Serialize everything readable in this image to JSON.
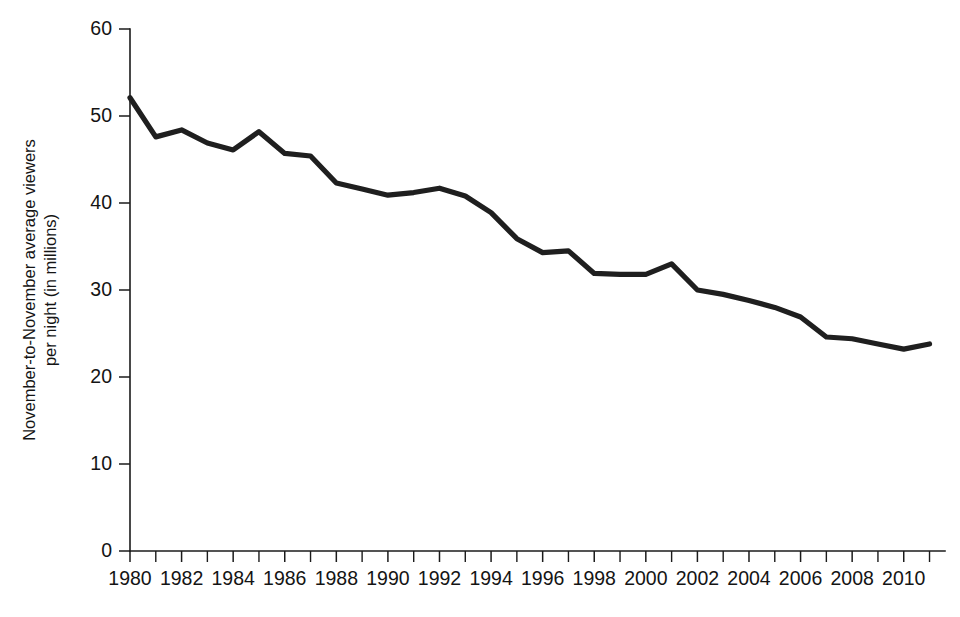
{
  "chart_data": {
    "type": "line",
    "title": "",
    "subtitle": "",
    "xlabel": "",
    "ylabel_line1": "November-to-November average viewers",
    "ylabel_line2": "per night  (in millions)",
    "ylabel": "November-to-November average viewers per night (in millions)",
    "grid": false,
    "legend_position": "none",
    "xlim": [
      1980,
      2011.6
    ],
    "ylim": [
      0,
      60
    ],
    "y_ticks": [
      0,
      10,
      20,
      30,
      40,
      50,
      60
    ],
    "y_tick_labels": [
      "0",
      "10",
      "20",
      "30",
      "40",
      "50",
      "60"
    ],
    "x_tick_minor_step": 1,
    "x_ticks": [
      1980,
      1982,
      1984,
      1986,
      1988,
      1990,
      1992,
      1994,
      1996,
      1998,
      2000,
      2002,
      2004,
      2006,
      2008,
      2010
    ],
    "x_tick_labels": [
      "1980",
      "1982",
      "1984",
      "1986",
      "1988",
      "1990",
      "1992",
      "1994",
      "1996",
      "1998",
      "2000",
      "2002",
      "2004",
      "2006",
      "2008",
      "2010"
    ],
    "x": [
      1980,
      1981,
      1982,
      1983,
      1984,
      1985,
      1986,
      1987,
      1988,
      1989,
      1990,
      1991,
      1992,
      1993,
      1994,
      1995,
      1996,
      1997,
      1998,
      1999,
      2000,
      2001,
      2002,
      2003,
      2004,
      2005,
      2006,
      2007,
      2008,
      2009,
      2010,
      2011
    ],
    "values": [
      52.1,
      47.6,
      48.4,
      46.9,
      46.1,
      48.2,
      45.7,
      45.4,
      42.3,
      41.6,
      40.9,
      41.2,
      41.7,
      40.8,
      38.9,
      35.9,
      34.3,
      34.5,
      31.9,
      31.8,
      31.8,
      33.0,
      30.0,
      29.5,
      28.8,
      28.0,
      26.9,
      24.6,
      24.4,
      23.8,
      23.2,
      23.8
    ],
    "series": [
      {
        "name": "November-to-November average viewers per night",
        "color": "#1f1f1f",
        "values": [
          52.1,
          47.6,
          48.4,
          46.9,
          46.1,
          48.2,
          45.7,
          45.4,
          42.3,
          41.6,
          40.9,
          41.2,
          41.7,
          40.8,
          38.9,
          35.9,
          34.3,
          34.5,
          31.9,
          31.8,
          31.8,
          33.0,
          30.0,
          29.5,
          28.8,
          28.0,
          26.9,
          24.6,
          24.4,
          23.8,
          23.2,
          23.8
        ]
      }
    ],
    "colors": {
      "line": "#1f1f1f",
      "axis": "#1b1b1b",
      "text": "#141414",
      "background": "#ffffff"
    }
  },
  "plot_geometry": {
    "left": 130,
    "right": 945,
    "top": 29,
    "bottom": 551
  }
}
